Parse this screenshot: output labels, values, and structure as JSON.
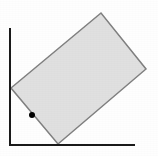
{
  "figure": {
    "width": 158,
    "height": 156,
    "background_color": "#fefefe"
  },
  "axes": {
    "name": "coordinate-axes",
    "color": "#1a1a1a",
    "stroke_width": 2,
    "origin": {
      "x": 10,
      "y": 145
    },
    "y_axis": {
      "x": 10,
      "y_top": 28,
      "y_bottom": 146
    },
    "x_axis": {
      "y": 145,
      "x_left": 10,
      "x_right": 135
    }
  },
  "shape": {
    "name": "rotated-rectangle",
    "type": "rectangle",
    "fill_color": "#e0e0e0",
    "stroke_color": "#808080",
    "stroke_width": 1.5,
    "rotation_degrees": -40,
    "points_attr": "11,88 101,13 146,69 58,144",
    "vertices": [
      {
        "label": "left",
        "x": 11,
        "y": 88
      },
      {
        "label": "top",
        "x": 101,
        "y": 13
      },
      {
        "label": "right",
        "x": 146,
        "y": 69
      },
      {
        "label": "bottom",
        "x": 58,
        "y": 144
      }
    ]
  },
  "marker": {
    "name": "vertex-point",
    "type": "filled-circle",
    "color": "#000000",
    "cx": 32,
    "cy": 115,
    "r": 3,
    "lies_on_edge": "left-to-bottom"
  }
}
